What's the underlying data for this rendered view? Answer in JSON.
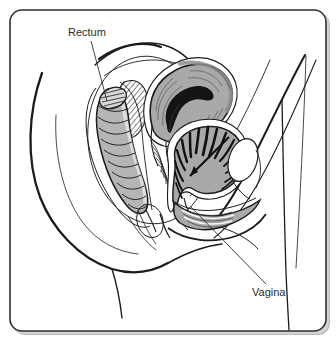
{
  "figure": {
    "background_color": "#ffffff",
    "frame": {
      "border_color": "#2f2f33",
      "fill_color": "#ffffff",
      "corner_radius": 12,
      "shadow_color": "#b9b9bd"
    },
    "ink_color": "#1c1c1c",
    "shade_colors": {
      "organ_gray": "#a9a9a9",
      "organ_gray_light": "#c6c6c6",
      "organ_gray_dark": "#8d8d8d",
      "cavity_black": "#141414",
      "tissue_white": "#ffffff"
    }
  },
  "labels": [
    {
      "id": "rectum",
      "text": "Rectum",
      "text_x": 68,
      "text_y": 36,
      "anchor": "start",
      "leader": {
        "x1": 91,
        "y1": 41,
        "x2": 107,
        "y2": 101
      }
    },
    {
      "id": "vagina",
      "text": "Vagina",
      "text_x": 252,
      "text_y": 296,
      "anchor": "start",
      "leader": {
        "x1": 190,
        "y1": 206,
        "x2": 266,
        "y2": 284
      }
    }
  ],
  "structures": [
    {
      "id": "body-outline",
      "name": "Body outline (buttock, abdomen, thigh)",
      "shaded": false
    },
    {
      "id": "rectum",
      "name": "Rectum",
      "shaded": true
    },
    {
      "id": "uterus",
      "name": "Uterus",
      "shaded": true
    },
    {
      "id": "bladder",
      "name": "Bladder",
      "shaded": true
    },
    {
      "id": "vaginal-canal",
      "name": "Vaginal canal",
      "shaded": true
    },
    {
      "id": "sacrum",
      "name": "Sacrum (cross-hatched bone)",
      "shaded": false
    },
    {
      "id": "pubic-bone",
      "name": "Pubic bone",
      "shaded": false
    }
  ]
}
